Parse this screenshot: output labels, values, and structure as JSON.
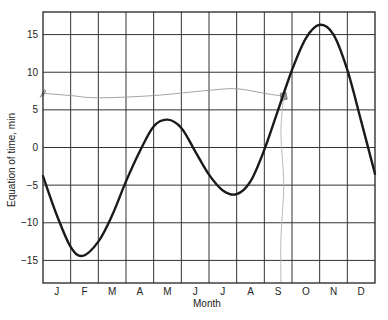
{
  "chart_data": {
    "type": "line",
    "title": "",
    "xlabel": "Month",
    "ylabel": "Equation of time, min",
    "categories": [
      "J",
      "F",
      "M",
      "A",
      "M",
      "J",
      "J",
      "A",
      "S",
      "O",
      "N",
      "D"
    ],
    "ylim": [
      -18,
      18
    ],
    "yticks": [
      15,
      10,
      5,
      0,
      -5,
      -10,
      -15
    ],
    "ytick_labels": [
      "15",
      "10",
      "5",
      "0",
      "−5",
      "−10",
      "−15"
    ],
    "grid": true,
    "legend": null,
    "x_unit": "month (0 = Jan 1, 12 = Dec 31)",
    "series": [
      {
        "name": "Equation of time",
        "color": "#1a1a1a",
        "x": [
          0,
          0.5,
          1,
          1.43,
          2,
          2.5,
          3,
          3.5,
          4,
          4.5,
          5,
          5.5,
          6,
          6.5,
          7,
          7.5,
          8,
          8.5,
          9,
          9.5,
          10,
          10.5,
          11,
          11.5,
          12
        ],
        "values": [
          -3.8,
          -9.0,
          -13.2,
          -14.4,
          -12.5,
          -9.0,
          -4.5,
          -0.5,
          2.8,
          3.7,
          2.6,
          -0.5,
          -3.6,
          -5.7,
          -6.2,
          -4.5,
          -0.3,
          5.0,
          10.3,
          14.5,
          16.3,
          15.0,
          10.3,
          3.5,
          -3.5
        ]
      }
    ],
    "annotations": [
      {
        "type": "hand-drawn line",
        "description": "faint pencil line near +7 min from left edge to a marker on the curve in September",
        "color": "#9a9a9a",
        "points": [
          [
            0,
            7.2
          ],
          [
            1,
            6.9
          ],
          [
            2,
            6.6
          ],
          [
            4,
            6.9
          ],
          [
            6,
            7.6
          ],
          [
            7,
            7.8
          ],
          [
            8,
            7.2
          ],
          [
            8.7,
            6.8
          ]
        ]
      },
      {
        "type": "marker",
        "description": "small hatched marker where pencil line meets the curve",
        "x": 8.7,
        "y": 6.8,
        "color": "#777777"
      },
      {
        "type": "hand-drawn line",
        "description": "faint vertical pencil line from marker down to the September axis label",
        "color": "#b0b0b0",
        "points": [
          [
            8.7,
            6.8
          ],
          [
            8.6,
            2
          ],
          [
            8.7,
            -5
          ],
          [
            8.6,
            -12
          ],
          [
            8.6,
            -18
          ]
        ]
      },
      {
        "type": "tick",
        "description": "small slash mark on y-axis at about 7 min",
        "x": 0,
        "y": 7.2
      }
    ]
  }
}
